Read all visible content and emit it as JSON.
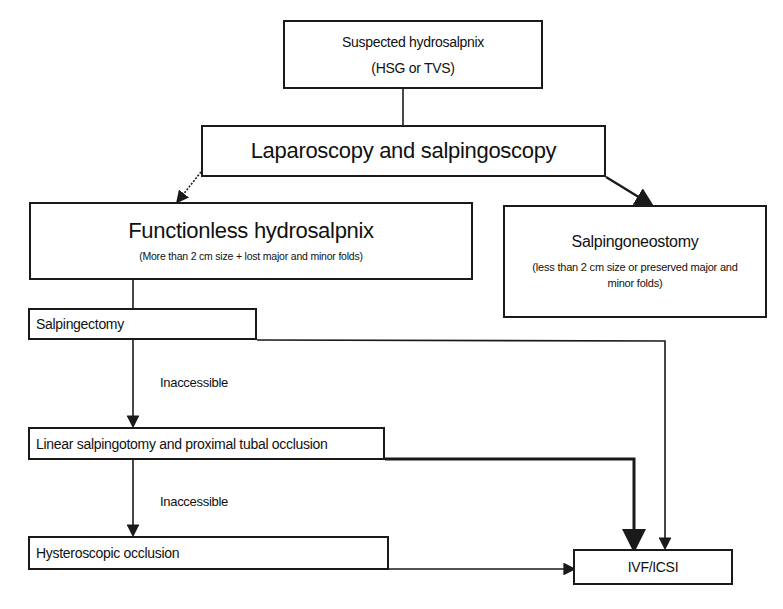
{
  "diagram": {
    "type": "flowchart",
    "nodes": {
      "suspected": {
        "line1": "Suspected hydrosalpnix",
        "line2": "(HSG or TVS)"
      },
      "laparoscopy": {
        "label": "Laparoscopy and salpingoscopy"
      },
      "functionless": {
        "title": "Functionless hydrosalpnix",
        "subtitle": "(More than 2 cm size + lost major and minor folds)"
      },
      "salpingoneostomy": {
        "title": "Salpingoneostomy",
        "subtitle": "(less than 2 cm size or preserved major and minor folds)"
      },
      "salpingectomy": {
        "label": "Salpingectomy"
      },
      "linear": {
        "label": "Linear salpingotomy and proximal tubal occlusion"
      },
      "hysteroscopic": {
        "label": "Hysteroscopic occlusion"
      },
      "ivf": {
        "label": "IVF/ICSI"
      }
    },
    "edge_labels": {
      "inaccessible_1": "Inaccessible",
      "inaccessible_2": "Inaccessible"
    },
    "edges": [
      {
        "from": "suspected",
        "to": "laparoscopy"
      },
      {
        "from": "laparoscopy",
        "to": "functionless"
      },
      {
        "from": "laparoscopy",
        "to": "salpingoneostomy"
      },
      {
        "from": "functionless",
        "to": "salpingectomy"
      },
      {
        "from": "salpingectomy",
        "to": "linear",
        "label": "Inaccessible"
      },
      {
        "from": "salpingectomy",
        "to": "ivf"
      },
      {
        "from": "linear",
        "to": "hysteroscopic",
        "label": "Inaccessible"
      },
      {
        "from": "linear",
        "to": "ivf"
      },
      {
        "from": "hysteroscopic",
        "to": "ivf"
      }
    ],
    "colors": {
      "line": "#1a1a1a",
      "background": "#ffffff"
    }
  }
}
